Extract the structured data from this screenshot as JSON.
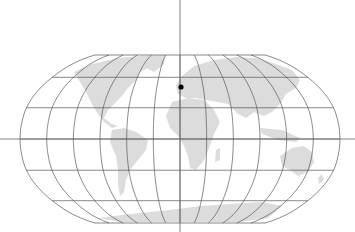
{
  "map": {
    "projection": "Robinson",
    "graticule_step_deg": {
      "lon": 30,
      "lat": 30
    },
    "marker": {
      "label": "",
      "color": "#000000",
      "approx_lon": 2,
      "approx_lat": 48
    },
    "colors": {
      "land": "#dcdcdc",
      "graticule": "#555555",
      "background": "#ffffff",
      "axes": "#666666"
    },
    "axes": {
      "equator_line": true,
      "prime_meridian_line": true
    }
  }
}
